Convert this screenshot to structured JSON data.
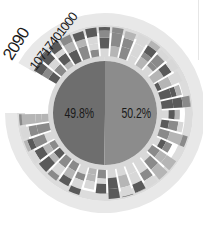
{
  "chart_data": {
    "type": "pie",
    "title": "",
    "center_labels": {
      "year": "2090",
      "total": "10717401000"
    },
    "pie": {
      "categories": [
        "Left segment",
        "Right segment"
      ],
      "values": [
        49.8,
        50.2
      ],
      "labels": [
        "49.8%",
        "50.2%"
      ],
      "colors": [
        "#6e6e6e",
        "#8c8c8c"
      ]
    },
    "radial_bars": {
      "description": "Radial stacked bars around the pie, each bar composed of grayscale segments",
      "count": 36,
      "start_angle_deg": -60,
      "end_angle_deg": 270,
      "segment_colors": [
        "#5a5a5a",
        "#8a8a8a",
        "#b5b5b5",
        "#d8d8d8"
      ]
    },
    "outer_ring_color": "#e8e8e8",
    "legend": null
  },
  "labels": {
    "year": "2090",
    "total": "10717401000",
    "left_pct": "49.8%",
    "right_pct": "50.2%"
  }
}
